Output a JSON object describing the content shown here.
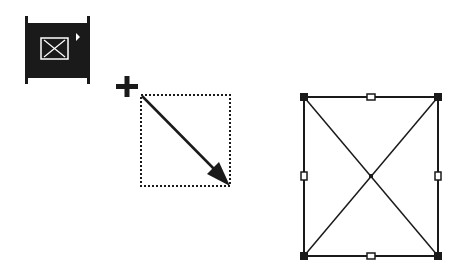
{
  "diagram": {
    "title": "Drawing a frame with the frame tool",
    "tool_button": {
      "icon": "frame-tool-icon",
      "has_submenu_indicator": true,
      "background": "#1a1a1a",
      "glyph_color": "#ffffff"
    },
    "drag_step": {
      "cursor": "crosshair-plus-icon",
      "marquee_style": "dotted",
      "drag_direction": "top-left to bottom-right",
      "arrow_icon": "drag-arrow-icon"
    },
    "result_frame": {
      "shape": "rectangle with diagonal X (empty picture frame)",
      "selection_handles": 8,
      "stroke": "#1a1a1a"
    }
  }
}
